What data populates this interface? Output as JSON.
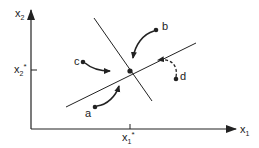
{
  "diagram": {
    "axes": {
      "x_label": "x",
      "x_sub": "1",
      "y_label": "x",
      "y_sub": "2"
    },
    "equilibrium": {
      "x_tick_label": "x",
      "x_tick_sub": "1",
      "x_tick_sup": "*",
      "y_tick_label": "x",
      "y_tick_sub": "2",
      "y_tick_sup": "*"
    },
    "points": [
      {
        "id": "a",
        "label": "a"
      },
      {
        "id": "b",
        "label": "b"
      },
      {
        "id": "c",
        "label": "c"
      },
      {
        "id": "d",
        "label": "d"
      }
    ],
    "colors": {
      "ink": "#222222",
      "background": "#ffffff"
    }
  }
}
